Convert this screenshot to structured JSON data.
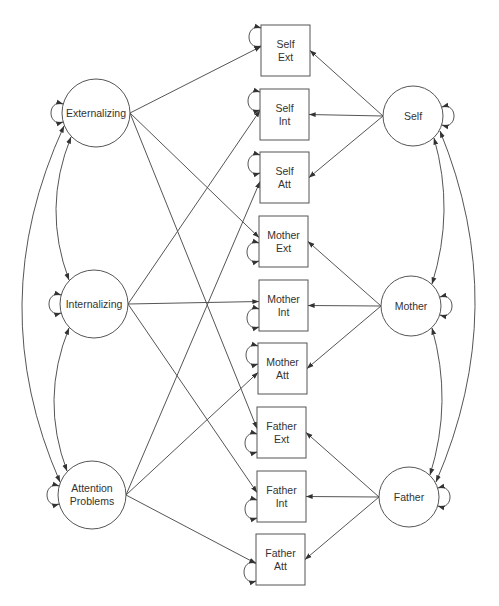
{
  "diagram": {
    "type": "path-diagram",
    "colors": {
      "stroke": "#555555",
      "text": "#333333",
      "background": "#ffffff"
    },
    "latent_left": [
      {
        "id": "ext",
        "lines": [
          "Externalizing"
        ],
        "cx": 96,
        "cy": 113,
        "r": 34
      },
      {
        "id": "int",
        "lines": [
          "Internalizing"
        ],
        "cx": 94,
        "cy": 304,
        "r": 34
      },
      {
        "id": "att",
        "lines": [
          "Attention",
          "Problems"
        ],
        "cx": 92,
        "cy": 495,
        "r": 34
      }
    ],
    "latent_right": [
      {
        "id": "self",
        "lines": [
          "Self"
        ],
        "cx": 413,
        "cy": 116,
        "r": 30
      },
      {
        "id": "mother",
        "lines": [
          "Mother"
        ],
        "cx": 411,
        "cy": 306,
        "r": 30
      },
      {
        "id": "father",
        "lines": [
          "Father"
        ],
        "cx": 409,
        "cy": 497,
        "r": 30
      }
    ],
    "observed": [
      {
        "id": "self_ext",
        "lines": [
          "Self",
          "Ext"
        ],
        "x": 261,
        "y": 25,
        "w": 49,
        "h": 51
      },
      {
        "id": "self_int",
        "lines": [
          "Self",
          "Int"
        ],
        "x": 260,
        "y": 89,
        "w": 49,
        "h": 51
      },
      {
        "id": "self_att",
        "lines": [
          "Self",
          "Att"
        ],
        "x": 260,
        "y": 152,
        "w": 49,
        "h": 51
      },
      {
        "id": "mother_ext",
        "lines": [
          "Mother",
          "Ext"
        ],
        "x": 259,
        "y": 216,
        "w": 49,
        "h": 51
      },
      {
        "id": "mother_int",
        "lines": [
          "Mother",
          "Int"
        ],
        "x": 259,
        "y": 280,
        "w": 49,
        "h": 51
      },
      {
        "id": "mother_att",
        "lines": [
          "Mother",
          "Att"
        ],
        "x": 258,
        "y": 343,
        "w": 49,
        "h": 51
      },
      {
        "id": "father_ext",
        "lines": [
          "Father",
          "Ext"
        ],
        "x": 257,
        "y": 407,
        "w": 49,
        "h": 51
      },
      {
        "id": "father_int",
        "lines": [
          "Father",
          "Int"
        ],
        "x": 257,
        "y": 471,
        "w": 49,
        "h": 51
      },
      {
        "id": "father_att",
        "lines": [
          "Father",
          "Att"
        ],
        "x": 256,
        "y": 534,
        "w": 49,
        "h": 51
      }
    ],
    "loadings_left": [
      [
        "ext",
        "self_ext"
      ],
      [
        "ext",
        "mother_ext"
      ],
      [
        "ext",
        "father_ext"
      ],
      [
        "int",
        "self_int"
      ],
      [
        "int",
        "mother_int"
      ],
      [
        "int",
        "father_int"
      ],
      [
        "att",
        "self_att"
      ],
      [
        "att",
        "mother_att"
      ],
      [
        "att",
        "father_att"
      ]
    ],
    "loadings_right": [
      [
        "self",
        "self_ext"
      ],
      [
        "self",
        "self_int"
      ],
      [
        "self",
        "self_att"
      ],
      [
        "mother",
        "mother_ext"
      ],
      [
        "mother",
        "mother_int"
      ],
      [
        "mother",
        "mother_att"
      ],
      [
        "father",
        "father_ext"
      ],
      [
        "father",
        "father_int"
      ],
      [
        "father",
        "father_att"
      ]
    ],
    "covariances_left": [
      [
        "ext",
        "int"
      ],
      [
        "int",
        "att"
      ],
      [
        "ext",
        "att"
      ]
    ],
    "covariances_right": [
      [
        "self",
        "mother"
      ],
      [
        "mother",
        "father"
      ],
      [
        "self",
        "father"
      ]
    ]
  }
}
